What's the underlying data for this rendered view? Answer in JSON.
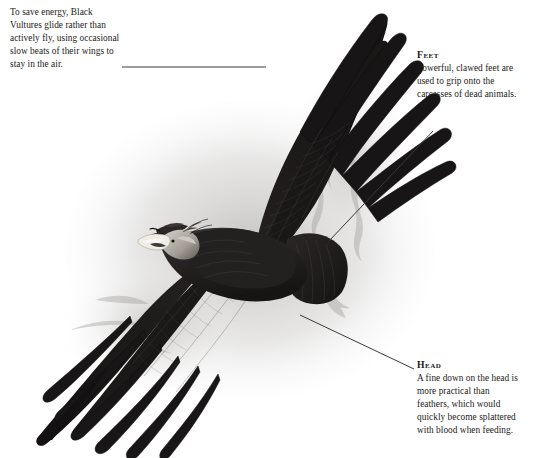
{
  "figure": {
    "background_color": "#ffffff",
    "ink_color": "#1c1a18",
    "leader_line_color": "#3a3a3a",
    "plumage_dark": "#191717",
    "plumage_mid": "#3b3836",
    "plumage_light": "#6d6866",
    "head_color": "#b9b2ac",
    "beak_color": "#efece6",
    "shadow_wash": "#c9c7c6"
  },
  "annotations": [
    {
      "id": "intro",
      "heading": "",
      "lines": [
        "To save energy, Black",
        "Vultures glide rather than",
        "actively fly, using occasional",
        "slow beats of their wings to",
        "stay in the air."
      ],
      "leader": {
        "from": [
          122,
          67
        ],
        "to": [
          266,
          67
        ]
      }
    },
    {
      "id": "feet",
      "heading": "Feet",
      "lines": [
        "Powerful, clawed feet are",
        "used to grip onto the",
        "carcasses of dead animals."
      ],
      "leader": {
        "from": [
          433,
          131
        ],
        "to": [
          329,
          241
        ]
      }
    },
    {
      "id": "head",
      "heading": "Head",
      "lines": [
        "A fine down on the head is",
        "more practical than",
        "feathers, which would",
        "quickly become splattered",
        "with blood when feeding."
      ],
      "leader": {
        "from": [
          414,
          369
        ],
        "to": [
          300,
          315
        ]
      }
    }
  ]
}
